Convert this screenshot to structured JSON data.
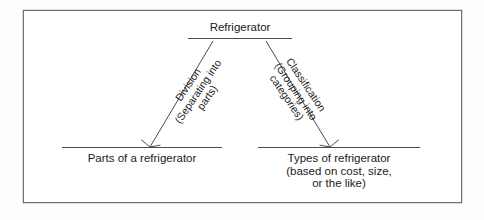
{
  "figure": {
    "type": "tree-diagram",
    "border_color": "#6f6f78",
    "background_color": "#ffffff",
    "text_color": "#1b1b1b",
    "line_color": "#4a4a52"
  },
  "diagram": {
    "root": {
      "label": "Refrigerator"
    },
    "edges": [
      {
        "name": "division",
        "title": "Division",
        "subtitle_line1": "(Separating into",
        "subtitle_line2": "parts)",
        "direction": "down-left",
        "arrowhead": "open-v"
      },
      {
        "name": "classification",
        "title": "Classification",
        "subtitle_line1": "(Grouping into",
        "subtitle_line2": "categories)",
        "direction": "down-right",
        "arrowhead": "open-v"
      }
    ],
    "children": [
      {
        "name": "parts-of-a-refrigerator",
        "lines": [
          "Parts of a refrigerator"
        ]
      },
      {
        "name": "types-of-refrigerator",
        "lines": [
          "Types of refrigerator",
          "(based on cost, size,",
          "or the like)"
        ]
      }
    ]
  }
}
